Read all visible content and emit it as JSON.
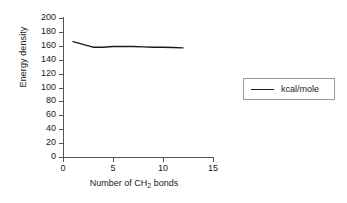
{
  "chart_data": {
    "type": "line",
    "title": "",
    "xlabel": "Number of CH2 bonds",
    "xlabel_prefix": "Number of CH",
    "xlabel_sub": "2",
    "xlabel_suffix": " bonds",
    "ylabel": "Energy density",
    "xlim": [
      0,
      15
    ],
    "ylim": [
      0,
      200
    ],
    "xticks": [
      0,
      5,
      10,
      15
    ],
    "yticks": [
      0,
      20,
      40,
      60,
      80,
      100,
      120,
      140,
      160,
      180,
      200
    ],
    "grid": false,
    "legend_position": "right",
    "series": [
      {
        "name": "kcal/mole",
        "color": "#1a1a1a",
        "x": [
          1,
          2,
          3,
          4,
          5,
          6,
          7,
          8,
          9,
          10,
          11,
          12
        ],
        "values": [
          166,
          162,
          158,
          158,
          159,
          159,
          159,
          158.5,
          158,
          158,
          157.5,
          157
        ]
      }
    ]
  },
  "axis": {
    "y_tick_labels": [
      "200",
      "180",
      "160",
      "140",
      "120",
      "100",
      "80",
      "60",
      "40",
      "20",
      "0"
    ],
    "x_tick_labels": [
      "0",
      "5",
      "10",
      "15"
    ],
    "y_title": "Energy density"
  },
  "legend": {
    "entries": [
      {
        "label": "kcal/mole"
      }
    ]
  }
}
